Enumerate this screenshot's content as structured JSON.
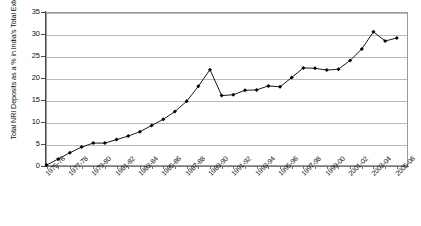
{
  "chart_data": {
    "type": "line",
    "title": "",
    "subtitle": "",
    "xlabel": "",
    "ylabel": "Total NRI Deposits as a % in India's Total External Debt",
    "ylim": [
      0,
      35
    ],
    "ytick_labels": [
      "0",
      "5",
      "10",
      "15",
      "20",
      "25",
      "30",
      "35"
    ],
    "ytick_values": [
      0,
      5,
      10,
      15,
      20,
      25,
      30,
      35
    ],
    "grid": true,
    "legend": "none",
    "marker": "filled-diamond",
    "line_color": "#000000",
    "marker_color": "#000000",
    "grid_color": "#b9b9b9",
    "categories": [
      "1975-76",
      "1976-77",
      "1977-78",
      "1978-79",
      "1979-80",
      "1980-81",
      "1981-82",
      "1982-83",
      "1983-84",
      "1984-85",
      "1985-86",
      "1986-87",
      "1987-88",
      "1988-89",
      "1989-90",
      "1990-91",
      "1991-92",
      "1992-93",
      "1993-94",
      "1994-95",
      "1995-96",
      "1996-97",
      "1997-98",
      "1998-99",
      "1999-00",
      "2000-01",
      "2001-02",
      "2002-03",
      "2003-04",
      "2004-05",
      "2005-06"
    ],
    "xtick_labels_shown": [
      "1975-76",
      "1977-78",
      "1979-80",
      "1981-82",
      "1983-84",
      "1985-86",
      "1987-88",
      "1989-90",
      "1991-92",
      "1993-94",
      "1995-96",
      "1997-98",
      "1999-00",
      "2001-02",
      "2003-04",
      "2005-06"
    ],
    "values": [
      0.2,
      1.6,
      3.0,
      4.3,
      5.2,
      5.2,
      6.0,
      6.8,
      7.8,
      9.2,
      10.6,
      12.4,
      14.7,
      18.1,
      21.9,
      16.0,
      16.2,
      17.2,
      17.3,
      18.2,
      18.0,
      20.1,
      22.3,
      22.2,
      21.8,
      22.0,
      24.0,
      26.6,
      30.5,
      28.4,
      29.1
    ]
  }
}
